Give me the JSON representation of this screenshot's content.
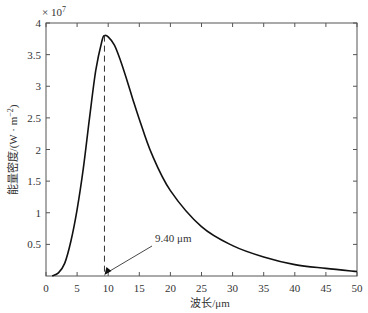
{
  "chart_data": {
    "type": "line",
    "title": "",
    "xlabel": "波长/μm",
    "ylabel": "能量密度/(W · m⁻²)",
    "y_multiplier": "× 10⁷",
    "xlim": [
      0,
      50
    ],
    "ylim": [
      0,
      4
    ],
    "grid": false,
    "x_ticks": [
      0,
      5,
      10,
      15,
      20,
      25,
      30,
      35,
      40,
      45,
      50
    ],
    "y_ticks": [
      0.5,
      1,
      1.5,
      2,
      2.5,
      3,
      3.5,
      4
    ],
    "y_tick_labels": [
      "0.5",
      "1",
      "1.5",
      "2",
      "2.5",
      "3",
      "3.5",
      "4"
    ],
    "series": [
      {
        "name": "energy density",
        "x": [
          1,
          2,
          3,
          4,
          5,
          6,
          7,
          8,
          9,
          9.4,
          10,
          11,
          12,
          13,
          14,
          15,
          17,
          20,
          25,
          30,
          35,
          40,
          45,
          50
        ],
        "values": [
          0,
          0.05,
          0.2,
          0.55,
          1.05,
          1.7,
          2.5,
          3.25,
          3.72,
          3.8,
          3.78,
          3.65,
          3.4,
          3.1,
          2.78,
          2.48,
          1.93,
          1.35,
          0.78,
          0.48,
          0.3,
          0.18,
          0.12,
          0.07
        ]
      }
    ],
    "annotations": [
      {
        "text": "9.40 μm",
        "x": 9.4,
        "y": 0,
        "type": "arrow"
      },
      {
        "type": "vline-dashed",
        "x": 9.4,
        "y_top": 3.8
      }
    ]
  },
  "labels": {
    "multiplier": "× 10",
    "multiplier_exp": "7",
    "xlabel": "波长/μm",
    "ylabel": "能量密度/(W · m",
    "ylabel_exp": "−2",
    "ylabel_close": ")",
    "annotation": "9.40 μm"
  }
}
